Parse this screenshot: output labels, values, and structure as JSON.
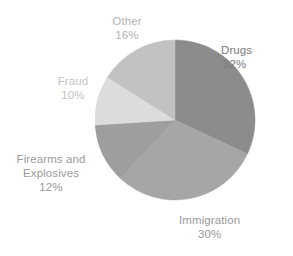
{
  "chart_data": {
    "type": "pie",
    "title": "",
    "subtitle": "",
    "xlabel": "",
    "ylabel": "",
    "legend": "none",
    "grid": false,
    "start_angle_deg": 0,
    "direction": "clockwise",
    "categories": [
      "Drugs",
      "Immigration",
      "Firearms and Explosives",
      "Fraud",
      "Other"
    ],
    "values": [
      32,
      30,
      12,
      10,
      16
    ],
    "value_unit": "%",
    "slices": [
      {
        "label": "Drugs",
        "value": 32,
        "value_text": "32%",
        "color": "#8c8c8c",
        "label_lines": [
          "Drugs",
          "32%"
        ],
        "label_color": "#7a7a7a"
      },
      {
        "label": "Immigration",
        "value": 30,
        "value_text": "30%",
        "color": "#a6a6a6",
        "label_lines": [
          "Immigration",
          "30%"
        ],
        "label_color": "#9a9a9a"
      },
      {
        "label": "Firearms and Explosives",
        "value": 12,
        "value_text": "12%",
        "color": "#9e9e9e",
        "label_lines": [
          "Firearms and",
          "Explosives",
          "12%"
        ],
        "label_color": "#9a9a9a"
      },
      {
        "label": "Fraud",
        "value": 10,
        "value_text": "10%",
        "color": "#dcdcdc",
        "label_lines": [
          "Fraud",
          "10%"
        ],
        "label_color": "#c4c4c4"
      },
      {
        "label": "Other",
        "value": 16,
        "value_text": "16%",
        "color": "#c2c2c2",
        "label_lines": [
          "Other",
          "16%"
        ],
        "label_color": "#b4b4b4"
      }
    ]
  },
  "labels": {
    "drugs": {
      "name": "Drugs",
      "value": "32%"
    },
    "immigration": {
      "name": "Immigration",
      "value": "30%"
    },
    "firearms": {
      "name_line1": "Firearms and",
      "name_line2": "Explosives",
      "value": "12%"
    },
    "fraud": {
      "name": "Fraud",
      "value": "10%"
    },
    "other": {
      "name": "Other",
      "value": "16%"
    }
  },
  "geometry": {
    "center_x": 175,
    "center_y": 120,
    "radius": 80
  },
  "colors": {
    "background": "#ffffff",
    "drugs": "#8c8c8c",
    "immigration": "#a6a6a6",
    "firearms": "#9e9e9e",
    "fraud": "#dcdcdc",
    "other": "#c2c2c2"
  }
}
